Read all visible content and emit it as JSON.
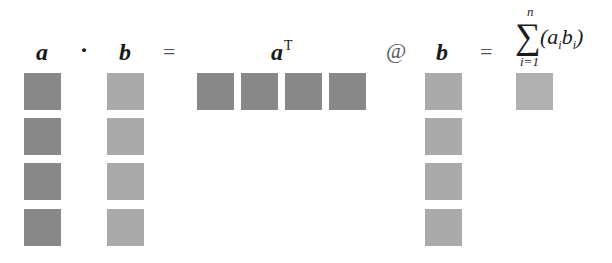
{
  "header": {
    "a_label": "a",
    "dot_op": "·",
    "b_label": "b",
    "eq1": "=",
    "aT_label": "a",
    "aT_sup": "T",
    "matmul_op": "@",
    "b2_label": "b",
    "eq2": "=",
    "sum": {
      "sigma": "∑",
      "upper": "n",
      "lower": "i=1",
      "open": "(",
      "a": "a",
      "a_sub": "i",
      "b": "b",
      "b_sub": "i",
      "close": ")"
    }
  },
  "vectors": {
    "a": {
      "length": 4,
      "color": "#888888",
      "orientation": "column"
    },
    "b": {
      "length": 4,
      "color": "#aaaaaa",
      "orientation": "column"
    },
    "aT": {
      "length": 4,
      "color": "#888888",
      "orientation": "row"
    },
    "b2": {
      "length": 4,
      "color": "#aaaaaa",
      "orientation": "column"
    },
    "result": {
      "length": 1,
      "color": "#b0b0b0",
      "orientation": "scalar"
    }
  }
}
